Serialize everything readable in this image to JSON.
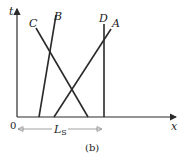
{
  "diagram": {
    "axes": {
      "x_label": "x",
      "t_label": "t",
      "origin_label": "0"
    },
    "worldlines": [
      {
        "label": "A",
        "x0": 54,
        "y0": 117,
        "x1": 111,
        "y1": 29,
        "lx": 112,
        "ly": 27
      },
      {
        "label": "B",
        "x0": 39,
        "y0": 117,
        "x1": 56,
        "y1": 15,
        "lx": 54,
        "ly": 20
      },
      {
        "label": "C",
        "x0": 36,
        "y0": 28,
        "x1": 88,
        "y1": 117,
        "lx": 29,
        "ly": 27
      },
      {
        "label": "D",
        "x0": 104,
        "y0": 117,
        "x1": 104,
        "y1": 24,
        "lx": 99,
        "ly": 22
      }
    ],
    "length_marker": {
      "label": "L",
      "subscript": "S"
    },
    "caption": "(b)",
    "colors": {
      "line": "#2a2a2a",
      "arrow": "#888888"
    }
  }
}
